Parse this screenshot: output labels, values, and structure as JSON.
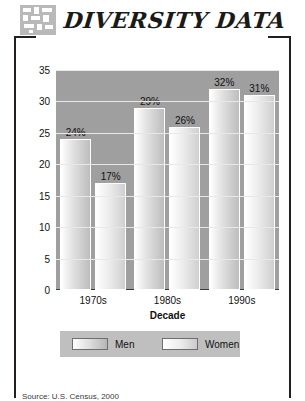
{
  "header": {
    "title": "DIVERSITY DATA",
    "badge_icon": "mosaic-tile-icon"
  },
  "chart_data": {
    "type": "bar",
    "title": "",
    "categories": [
      "1970s",
      "1980s",
      "1990s"
    ],
    "series": [
      {
        "name": "Men",
        "values": [
          24,
          29,
          32
        ],
        "labels": [
          "24%",
          "29%",
          "32%"
        ]
      },
      {
        "name": "Women",
        "values": [
          17,
          26,
          31
        ],
        "labels": [
          "17%",
          "26%",
          "31%"
        ]
      }
    ],
    "xlabel": "Decade",
    "ylabel": "Percent of 20- to 40-year-olds with a College Degree",
    "ylabel_line1": "Percent of 20- to 40-year-olds",
    "ylabel_line2": "with a College Degree",
    "ylim": [
      0,
      35
    ],
    "yticks": [
      0,
      5,
      10,
      15,
      20,
      25,
      30,
      35
    ],
    "ytick_labels": [
      "0",
      "5",
      "10",
      "15",
      "20",
      "25",
      "30",
      "35"
    ],
    "grid": true,
    "legend_position": "bottom",
    "plot_background": "#9f9f9f",
    "gridline_color": "#e8e8e8"
  },
  "legend": {
    "items": [
      {
        "label": "Men"
      },
      {
        "label": "Women"
      }
    ]
  },
  "caption": {
    "text": "Source: U.S. Census, 2000"
  }
}
